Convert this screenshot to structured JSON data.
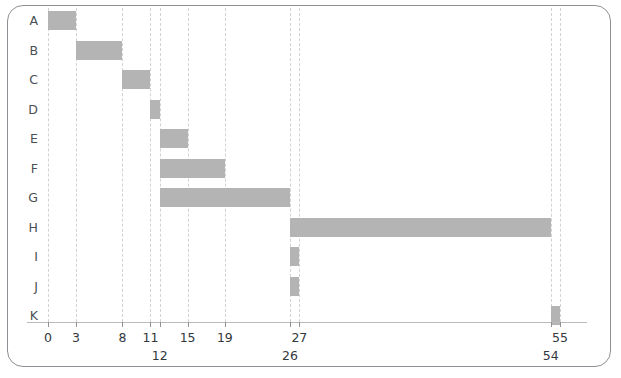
{
  "chart_data": {
    "type": "bar",
    "title": "",
    "subtitle": "",
    "xlabel": "",
    "ylabel": "",
    "orientation": "horizontal",
    "variant": "gantt",
    "grid": true,
    "legend": null,
    "xlim": [
      0,
      55
    ],
    "categories": [
      "A",
      "B",
      "C",
      "D",
      "E",
      "F",
      "G",
      "H",
      "I",
      "J",
      "K"
    ],
    "tasks": [
      {
        "label": "A",
        "start": 0,
        "end": 3,
        "duration": 3
      },
      {
        "label": "B",
        "start": 3,
        "end": 8,
        "duration": 5
      },
      {
        "label": "C",
        "start": 8,
        "end": 11,
        "duration": 3
      },
      {
        "label": "D",
        "start": 11,
        "end": 12,
        "duration": 1
      },
      {
        "label": "E",
        "start": 12,
        "end": 15,
        "duration": 3
      },
      {
        "label": "F",
        "start": 12,
        "end": 19,
        "duration": 7
      },
      {
        "label": "G",
        "start": 12,
        "end": 26,
        "duration": 14
      },
      {
        "label": "H",
        "start": 26,
        "end": 54,
        "duration": 28
      },
      {
        "label": "I",
        "start": 26,
        "end": 27,
        "duration": 1
      },
      {
        "label": "J",
        "start": 26,
        "end": 27,
        "duration": 1
      },
      {
        "label": "K",
        "start": 54,
        "end": 55,
        "duration": 1
      }
    ],
    "xticks": [
      {
        "value": 0,
        "label": "0",
        "row": "upper"
      },
      {
        "value": 3,
        "label": "3",
        "row": "upper"
      },
      {
        "value": 8,
        "label": "8",
        "row": "upper"
      },
      {
        "value": 11,
        "label": "11",
        "row": "upper"
      },
      {
        "value": 12,
        "label": "12",
        "row": "lower"
      },
      {
        "value": 15,
        "label": "15",
        "row": "upper"
      },
      {
        "value": 19,
        "label": "19",
        "row": "upper"
      },
      {
        "value": 26,
        "label": "26",
        "row": "lower"
      },
      {
        "value": 27,
        "label": "27",
        "row": "upper"
      },
      {
        "value": 54,
        "label": "54",
        "row": "lower"
      },
      {
        "value": 55,
        "label": "55",
        "row": "upper"
      }
    ],
    "gridlines": [
      0,
      3,
      8,
      11,
      12,
      15,
      19,
      26,
      27,
      54,
      55
    ],
    "colors": {
      "bar": "#b4b4b4",
      "grid": "#d2d2d2",
      "axis": "#b9bcbe",
      "tick": "#8e9295",
      "label": "#33383d",
      "row_label": "#4a4f54",
      "frame": "#8c9094",
      "background": "#ffffff"
    }
  }
}
